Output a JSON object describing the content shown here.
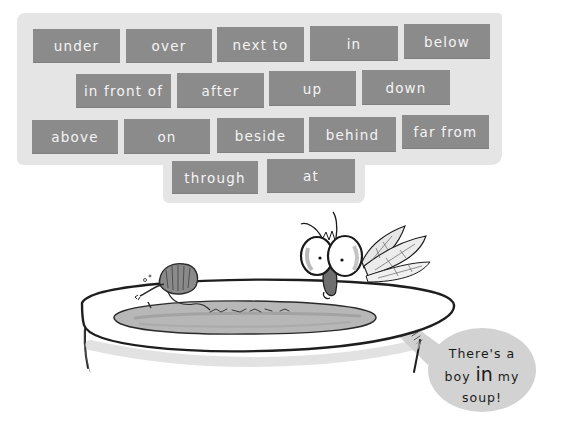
{
  "word_wall": {
    "background_color": "#e5e5e5",
    "brick_color": "#8b8b8b",
    "text_color": "#f4f4f4",
    "rows": [
      [
        "under",
        "over",
        "next to",
        "in",
        "below"
      ],
      [
        "in front of",
        "after",
        "up",
        "down"
      ],
      [
        "above",
        "on",
        "beside",
        "behind",
        "far from"
      ],
      [
        "through",
        "at"
      ]
    ],
    "words": {
      "r0c0": "under",
      "r0c1": "over",
      "r0c2": "next to",
      "r0c3": "in",
      "r0c4": "below",
      "r1c0": "in front of",
      "r1c1": "after",
      "r1c2": "up",
      "r1c3": "down",
      "r2c0": "above",
      "r2c1": "on",
      "r2c2": "beside",
      "r2c3": "behind",
      "r2c4": "far from",
      "r3c0": "through",
      "r3c1": "at"
    }
  },
  "illustration": {
    "scene": "soup-bowl-with-boy-and-fly",
    "speech_bubble": {
      "line1": "There's a",
      "line2_pre": "boy ",
      "line2_emphasis": "in",
      "line2_post": " my",
      "line3": "soup!",
      "fill_color": "#d2d2d2"
    }
  }
}
